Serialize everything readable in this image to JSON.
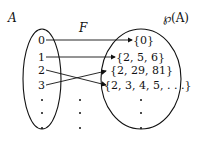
{
  "diagram": {
    "domain_label": "A",
    "function_label": "F",
    "codomain_label": "℘(A)",
    "domain_elements": [
      "0",
      "1",
      "2",
      "3"
    ],
    "codomain_elements": [
      "{0}",
      "{2, 5, 6}",
      "{2, 29, 81}",
      "{2, 3, 4, 5, . . .}"
    ],
    "mappings": [
      {
        "from": "0",
        "to": "{0}"
      },
      {
        "from": "1",
        "to": "{2, 5, 6}"
      },
      {
        "from": "2",
        "to": "{2, 3, 4, 5, . . .}"
      },
      {
        "from": "3",
        "to": "{2, 29, 81}"
      }
    ],
    "ellipsis": "⋮"
  }
}
